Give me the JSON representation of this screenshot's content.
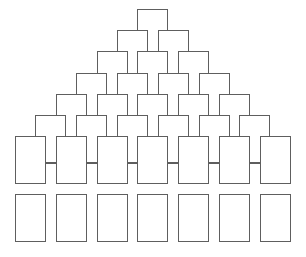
{
  "diagram": {
    "type": "box-pyramid",
    "line_color": "#5e5e5e",
    "background": "#ffffff",
    "columns": 7,
    "column_step": 40.8,
    "box_width": 31,
    "box_height": 48,
    "pyramid": {
      "rows": [
        1,
        2,
        3,
        4,
        5,
        6
      ],
      "first_top": 9,
      "row_step": 21.2,
      "first_left_base": 15,
      "row_shift": 20.4
    },
    "large_row": {
      "count": 7,
      "top": 136,
      "left": 15,
      "connected": true,
      "connector_y": 163
    },
    "bottom_row": {
      "count": 7,
      "top": 194,
      "left": 15,
      "connected": false
    }
  }
}
